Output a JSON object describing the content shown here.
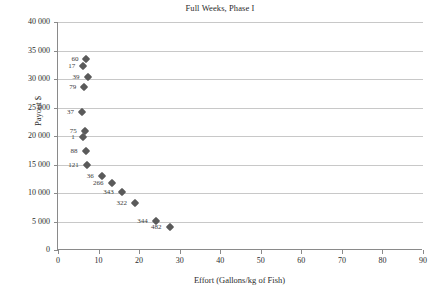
{
  "chart_data": {
    "type": "scatter",
    "title": "Full Weeks, Phase I",
    "xlabel": "Effort (Gallons/kg of Fish)",
    "ylabel": "Payout $",
    "xlim": [
      0,
      90
    ],
    "ylim": [
      0,
      40000
    ],
    "xticks": [
      "0",
      "10",
      "20",
      "30",
      "40",
      "50",
      "60",
      "70",
      "80",
      "90"
    ],
    "xtick_values": [
      0,
      10,
      20,
      30,
      40,
      50,
      60,
      70,
      80,
      90
    ],
    "yticks": [
      "0",
      "5 000",
      "10 000",
      "15 000",
      "20 000",
      "25 000",
      "30 000",
      "35 000",
      "40 000"
    ],
    "ytick_values": [
      0,
      5000,
      10000,
      15000,
      20000,
      25000,
      30000,
      35000,
      40000
    ],
    "grid": "horizontal",
    "legend": "none",
    "marker_shape": "diamond",
    "marker_color": "#5a5a5a",
    "points": [
      {
        "label": "60",
        "x": 7.0,
        "y": 33500
      },
      {
        "label": "17",
        "x": 6.2,
        "y": 32200
      },
      {
        "label": "39",
        "x": 7.3,
        "y": 30300
      },
      {
        "label": "79",
        "x": 6.5,
        "y": 28600
      },
      {
        "label": "37",
        "x": 5.9,
        "y": 24200
      },
      {
        "label": "75",
        "x": 6.6,
        "y": 20800
      },
      {
        "label": "1",
        "x": 6.1,
        "y": 19800
      },
      {
        "label": "88",
        "x": 6.8,
        "y": 17400
      },
      {
        "label": "121",
        "x": 7.1,
        "y": 15000
      },
      {
        "label": "36",
        "x": 10.8,
        "y": 12950
      },
      {
        "label": "266",
        "x": 13.2,
        "y": 11800
      },
      {
        "label": "343",
        "x": 15.7,
        "y": 10100
      },
      {
        "label": "322",
        "x": 19.0,
        "y": 8200
      },
      {
        "label": "344",
        "x": 24.1,
        "y": 5050
      },
      {
        "label": "482",
        "x": 27.5,
        "y": 4050
      }
    ]
  }
}
